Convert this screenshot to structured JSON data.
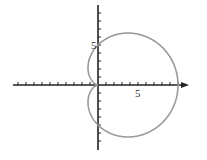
{
  "chart_data": {
    "type": "line",
    "title": "",
    "subtitle": "",
    "xlabel": "",
    "ylabel": "",
    "equation": "r = 5(1 + cos θ)",
    "xlim": [
      -11,
      11
    ],
    "ylim": [
      -9,
      10
    ],
    "grid": false,
    "legend": null,
    "tick_labels": {
      "x": [
        "5"
      ],
      "y": [
        "5"
      ]
    },
    "tick_spacing": 1,
    "series": [
      {
        "name": "cardioid",
        "color": "#9a9a9a",
        "points": [
          {
            "x": 10,
            "y": 0
          },
          {
            "x": 8.1,
            "y": 4.7
          },
          {
            "x": 3.75,
            "y": 6.5
          },
          {
            "x": 0,
            "y": 5
          },
          {
            "x": -1.25,
            "y": 2.17
          },
          {
            "x": 0,
            "y": 0
          },
          {
            "x": -1.25,
            "y": -2.17
          },
          {
            "x": 0,
            "y": -5
          },
          {
            "x": 3.75,
            "y": -6.5
          },
          {
            "x": 8.1,
            "y": -4.7
          },
          {
            "x": 10,
            "y": 0
          }
        ]
      }
    ]
  },
  "labels": {
    "x_tick_5": "5",
    "y_tick_5": "5"
  },
  "colors": {
    "axis": "#222222",
    "curve": "#9a9a9a"
  }
}
